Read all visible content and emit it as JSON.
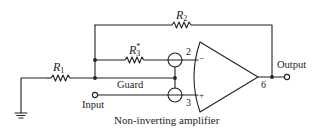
{
  "caption": "Non-inverting amplifier",
  "components": {
    "r1": {
      "symbol": "R",
      "sub": "1"
    },
    "r2": {
      "symbol": "R",
      "sub": "2"
    },
    "r3": {
      "symbol": "R",
      "sub": "3",
      "sup": "*"
    }
  },
  "labels": {
    "guard": "Guard",
    "input": "Input",
    "output": "Output",
    "pin_inverting": "2",
    "pin_noninverting": "3",
    "pin_output": "6",
    "sign_minus": "−",
    "sign_plus": "+"
  },
  "colors": {
    "ink": "#222222",
    "background": "#ffffff"
  }
}
